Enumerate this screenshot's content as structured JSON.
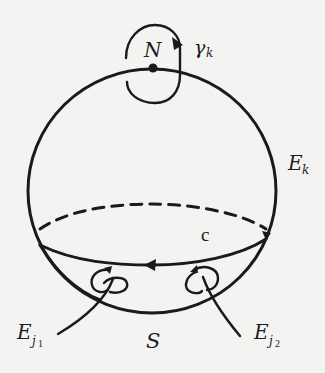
{
  "diagram": {
    "type": "sphere-with-loops",
    "labels": {
      "north_pole": "N",
      "gamma": "γ",
      "gamma_sub": "k",
      "cap_label": "E",
      "cap_sub": "k",
      "equator": "c",
      "south": "S",
      "ej1_main": "E",
      "ej1_sub": "j",
      "ej1_subsub": "1",
      "ej2_main": "E",
      "ej2_sub": "j",
      "ej2_subsub": "2"
    },
    "colors": {
      "ink": "#1a1a1a",
      "paper": "#f3f3f1"
    }
  }
}
